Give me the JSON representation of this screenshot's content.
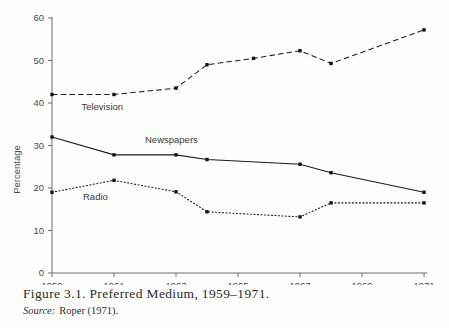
{
  "caption": {
    "figure_text": "Figure 3.1. Preferred Medium, 1959–1971.",
    "source_label": "Source:",
    "source_text": "Roper (1971)."
  },
  "chart_data": {
    "type": "line",
    "title": "",
    "xlabel": "",
    "ylabel": "Percentage",
    "xlim": [
      1959,
      1971
    ],
    "ylim": [
      0,
      60
    ],
    "yticks": [
      0,
      10,
      20,
      30,
      40,
      50,
      60
    ],
    "ytick_labels": [
      "0",
      "10",
      "20",
      "30",
      "40",
      "50",
      "60"
    ],
    "xticks": [
      1959,
      1961,
      1963,
      1965,
      1967,
      1969,
      1971
    ],
    "xtick_labels": [
      "1959",
      "1961",
      "1963",
      "1965",
      "1967",
      "1969",
      "1971"
    ],
    "grid": false,
    "legend": "inline-labels",
    "series": [
      {
        "name": "Television",
        "style": "dashed",
        "label_x": 1959.95,
        "label_y": 38.3,
        "x": [
          1959,
          1961,
          1963,
          1964,
          1965.5,
          1967,
          1968,
          1971
        ],
        "values": [
          42.0,
          42.0,
          43.5,
          49.0,
          50.5,
          52.3,
          49.3,
          57.2
        ]
      },
      {
        "name": "Newspapers",
        "style": "solid",
        "label_x": 1962.0,
        "label_y": 30.6,
        "x": [
          1959,
          1961,
          1963,
          1964,
          1967,
          1968,
          1971
        ],
        "values": [
          32.0,
          27.8,
          27.8,
          26.7,
          25.6,
          23.6,
          19.0
        ]
      },
      {
        "name": "Radio",
        "style": "dotted",
        "label_x": 1960.0,
        "label_y": 17.1,
        "x": [
          1959,
          1961,
          1963,
          1964,
          1967,
          1968,
          1971
        ],
        "values": [
          19.0,
          21.8,
          19.1,
          14.4,
          13.2,
          16.5,
          16.5
        ]
      }
    ]
  }
}
